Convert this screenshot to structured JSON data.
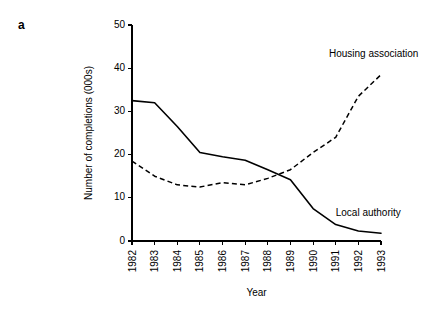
{
  "figure": {
    "panel_label": "a"
  },
  "chart_data": {
    "type": "line",
    "title": "",
    "xlabel": "Year",
    "ylabel": "Number of completions  (000s)",
    "categories": [
      "1982",
      "1983",
      "1984",
      "1985",
      "1986",
      "1987",
      "1988",
      "1989",
      "1990",
      "1991",
      "1992",
      "1993"
    ],
    "x": [
      1982,
      1983,
      1984,
      1985,
      1986,
      1987,
      1988,
      1989,
      1990,
      1991,
      1992,
      1993
    ],
    "ylim": [
      0,
      50
    ],
    "xlim": [
      1982,
      1993
    ],
    "yticks": [
      0,
      10,
      20,
      30,
      40,
      50
    ],
    "ytick_labels": [
      "0",
      "10",
      "20",
      "30",
      "40",
      "50"
    ],
    "xticks": [
      1982,
      1983,
      1984,
      1985,
      1986,
      1987,
      1988,
      1989,
      1990,
      1991,
      1992,
      1993
    ],
    "xtick_labels": [
      "1982",
      "1983",
      "1984",
      "1985",
      "1986",
      "1987",
      "1988",
      "1989",
      "1990",
      "1991",
      "1992",
      "1993"
    ],
    "xtick_rotation": 90,
    "grid": false,
    "legend": "inline-annotations",
    "series": [
      {
        "name": "Local authority",
        "style": "solid",
        "color": "#000000",
        "values": [
          32.5,
          32.0,
          26.5,
          20.5,
          19.5,
          18.7,
          16.5,
          14.2,
          7.5,
          3.8,
          2.3,
          1.8
        ],
        "label_x": 1991.0,
        "label_y": 5.8
      },
      {
        "name": "Housing association",
        "style": "dashed",
        "color": "#000000",
        "values": [
          18.5,
          15.0,
          13.0,
          12.5,
          13.5,
          13.0,
          14.5,
          16.5,
          20.5,
          24.0,
          33.5,
          38.5
        ],
        "label_x": 1990.7,
        "label_y": 42.5
      }
    ],
    "annotations": [
      {
        "text": "Housing association",
        "x": 1990.7,
        "y": 42.5
      },
      {
        "text": "Local authority",
        "x": 1991.0,
        "y": 5.8
      }
    ]
  }
}
